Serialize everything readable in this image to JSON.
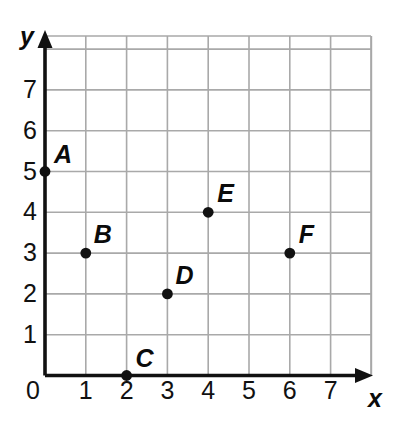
{
  "chart_data": {
    "type": "scatter",
    "title": "",
    "xlabel": "x",
    "ylabel": "y",
    "xlim": [
      0,
      8
    ],
    "ylim": [
      0,
      8
    ],
    "grid": true,
    "legend": "none",
    "x_ticks": [
      "0",
      "1",
      "2",
      "3",
      "4",
      "5",
      "6",
      "7"
    ],
    "y_ticks": [
      "1",
      "2",
      "3",
      "4",
      "5",
      "6",
      "7"
    ],
    "origin_label": "0",
    "points": [
      {
        "label": "A",
        "x": 0,
        "y": 5
      },
      {
        "label": "B",
        "x": 1,
        "y": 3
      },
      {
        "label": "C",
        "x": 2,
        "y": 0
      },
      {
        "label": "D",
        "x": 3,
        "y": 2
      },
      {
        "label": "E",
        "x": 4,
        "y": 4
      },
      {
        "label": "F",
        "x": 6,
        "y": 3
      }
    ]
  },
  "colors": {
    "background": "#ffffff",
    "grid_line": "#a9a9a9",
    "axis_line": "#111111",
    "point_fill": "#111111",
    "text": "#0b0b0b"
  },
  "geometry": {
    "origin_px": {
      "x": 45,
      "y": 375.5
    },
    "unit_px": 40.8,
    "grid_right_px": 371,
    "grid_top_px": 36
  },
  "axis": {
    "x_name": "x",
    "y_name": "y"
  }
}
